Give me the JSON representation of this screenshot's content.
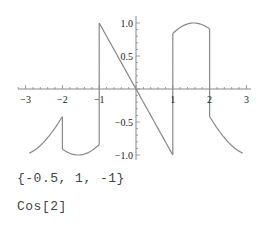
{
  "chart_data": {
    "type": "line",
    "title": "",
    "xlabel": "",
    "ylabel": "",
    "xlim": [
      -3,
      3
    ],
    "ylim": [
      -1.0,
      1.0
    ],
    "grid": false,
    "legend": null,
    "x_ticks": [
      "-3",
      "-2",
      "-1",
      "1",
      "2",
      "3"
    ],
    "y_ticks": [
      "1.0",
      "0.5",
      "-0.5",
      "-1.0"
    ],
    "series": [
      {
        "name": "piecewise",
        "description": "Cos[x] for x<-2; Sin[x] for -2<=x<-1; -x for -1<=x<1; Sin[x] for 1<=x<2; Cos[x] for x>=2",
        "segments": [
          {
            "x": [
              -2.9,
              -2.7,
              -2.5,
              -2.3,
              -2.0
            ],
            "y": [
              -0.74,
              -0.67,
              -0.59,
              -0.52,
              -0.42
            ]
          },
          {
            "x": [
              -2.0,
              -1.8,
              -1.57,
              -1.3,
              -1.0
            ],
            "y": [
              -0.91,
              -0.97,
              -1.0,
              -0.96,
              -0.84
            ]
          },
          {
            "x": [
              -1.0,
              0.0,
              1.0
            ],
            "y": [
              1.0,
              0.0,
              -1.0
            ]
          },
          {
            "x": [
              1.0,
              1.2,
              1.57,
              1.8,
              2.0
            ],
            "y": [
              0.84,
              0.93,
              1.0,
              0.97,
              0.91
            ]
          },
          {
            "x": [
              2.0,
              2.3,
              2.6,
              2.9
            ],
            "y": [
              -0.42,
              -0.67,
              -0.86,
              -0.97
            ]
          }
        ],
        "color": "#888888"
      }
    ],
    "axis_color": "#888888"
  },
  "output": {
    "line1": "{-0.5, 1, -1}",
    "line2": "Cos[2]"
  }
}
